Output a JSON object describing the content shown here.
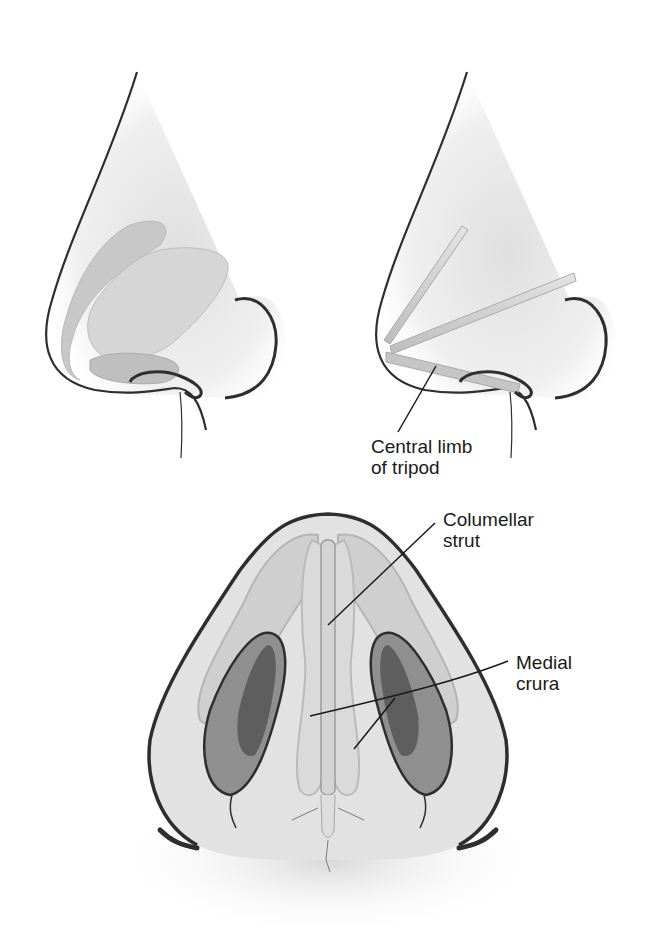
{
  "figure": {
    "panels": [
      {
        "id": "lateral-before",
        "description": "Lateral view of nasal tip with lower lateral cartilages"
      },
      {
        "id": "lateral-tripod",
        "description": "Lateral view showing tripod limbs"
      },
      {
        "id": "basal-view",
        "description": "Basal view of nose with columellar strut"
      }
    ],
    "labels": {
      "central_limb": {
        "line1": "Central limb",
        "line2": "of tripod"
      },
      "columellar_strut": {
        "line1": "Columellar",
        "line2": "strut"
      },
      "medial_crura": {
        "line1": "Medial",
        "line2": "crura"
      }
    },
    "colors": {
      "outline": "#2e2e2e",
      "skin": "#ececec",
      "cartilage": "#c9c9c9",
      "cartilage_dark": "#a8a8a8",
      "nostril_dark": "#6b6b6b",
      "nostril_mid": "#8e8e8e"
    }
  }
}
